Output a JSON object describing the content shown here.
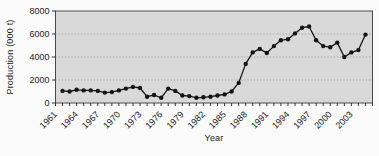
{
  "chart_data": {
    "type": "line",
    "title": "",
    "xlabel": "Year",
    "ylabel": "Production (000 t)",
    "x": [
      1962,
      1963,
      1964,
      1965,
      1966,
      1967,
      1968,
      1969,
      1970,
      1971,
      1972,
      1973,
      1974,
      1975,
      1976,
      1977,
      1978,
      1979,
      1980,
      1981,
      1982,
      1983,
      1984,
      1985,
      1986,
      1987,
      1988,
      1989,
      1990,
      1991,
      1992,
      1993,
      1994,
      1995,
      1996,
      1997,
      1998,
      1999,
      2000,
      2001,
      2002,
      2003,
      2004,
      2005
    ],
    "values": [
      1050,
      1000,
      1150,
      1100,
      1100,
      1050,
      900,
      950,
      1100,
      1250,
      1400,
      1300,
      550,
      700,
      450,
      1250,
      1050,
      650,
      600,
      450,
      500,
      550,
      650,
      750,
      1000,
      1750,
      3400,
      4400,
      4700,
      4350,
      4950,
      5450,
      5550,
      6050,
      6550,
      6650,
      5450,
      4950,
      4850,
      5250,
      4000,
      4400,
      4600,
      5950
    ],
    "xaxis_range": [
      1961,
      2006
    ],
    "ylim": [
      0,
      8000
    ],
    "yticks": [
      0,
      2000,
      4000,
      6000,
      8000
    ],
    "xtick_label_years": [
      1961,
      1964,
      1967,
      1970,
      1973,
      1976,
      1979,
      1982,
      1985,
      1988,
      1991,
      1994,
      1997,
      2000,
      2003
    ],
    "x_minor_tick_every": 1,
    "grid": "horizontal-dotted",
    "legend": "none",
    "marker": "filled-circle",
    "styles": {
      "plot_bg": "#d9d9d9",
      "plot_border": "#4a4a4a",
      "line_color": "#151515",
      "marker_color": "#151515",
      "grid_color": "#9b9b9b",
      "tick_color": "#333333",
      "text_color": "#1a1a1a"
    }
  }
}
